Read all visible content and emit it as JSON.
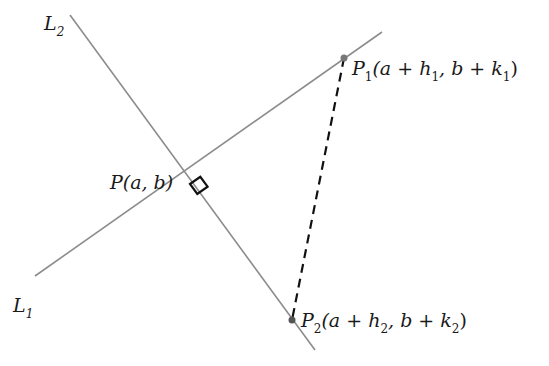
{
  "diagram": {
    "type": "geometry",
    "colors": {
      "line": "#8c8c8c",
      "dashed": "#111111",
      "right_angle": "#111111",
      "point": "#777777",
      "text": "#1a1a1a"
    },
    "lines": [
      {
        "id": "L1",
        "label": "L",
        "subscript": "1",
        "x1": 35,
        "y1": 276,
        "x2": 382,
        "y2": 32
      },
      {
        "id": "L2",
        "label": "L",
        "subscript": "2",
        "x1": 70,
        "y1": 15,
        "x2": 315,
        "y2": 350
      }
    ],
    "points": {
      "P": {
        "name": "P",
        "coords": "(a, b)",
        "x": 190,
        "y": 184
      },
      "P1": {
        "name": "P",
        "subscript": "1",
        "coords_prefix": "(a + h",
        "coords_sub1": "1",
        "coords_mid": ", b + k",
        "coords_sub2": "1",
        "coords_suffix": ")",
        "x": 344,
        "y": 58
      },
      "P2": {
        "name": "P",
        "subscript": "2",
        "coords_prefix": "(a + h",
        "coords_sub1": "2",
        "coords_mid": ", b + k",
        "coords_sub2": "2",
        "coords_suffix": ")",
        "x": 292,
        "y": 320
      }
    },
    "dashed_segment": {
      "from": "P1",
      "to": "P2"
    },
    "right_angle_marker": {
      "at": "P"
    }
  }
}
